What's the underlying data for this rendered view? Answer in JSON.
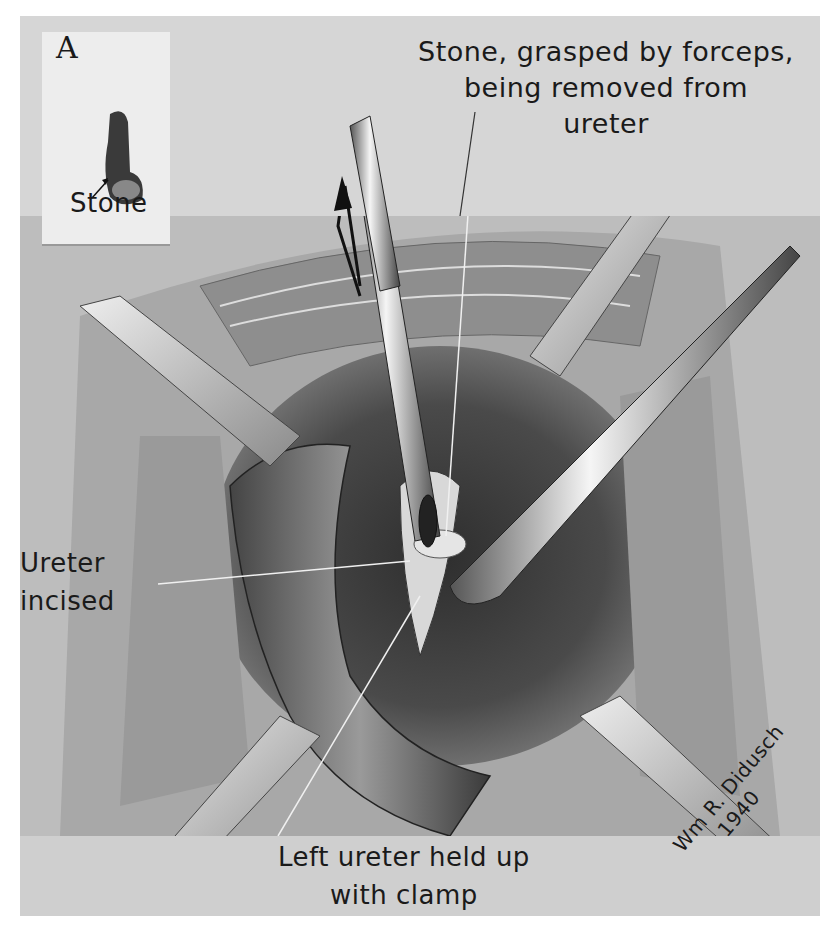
{
  "figure": {
    "panel_letter": "A",
    "inset": {
      "label": "Stone"
    },
    "labels": {
      "stone_forceps_line1": "Stone, grasped by forceps,",
      "stone_forceps_line2": "being removed from",
      "stone_forceps_line3": "ureter",
      "ureter_incised_line1": "Ureter",
      "ureter_incised_line2": "incised",
      "left_ureter_line1": "Left ureter held up",
      "left_ureter_line2": "with clamp"
    },
    "signature": {
      "name": "Wm R. Didusch",
      "year": "1940"
    }
  }
}
